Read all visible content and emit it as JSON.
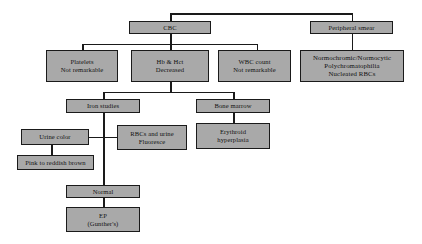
{
  "diagram": {
    "style": {
      "box_fill": "#a9a9a9",
      "box_border": "#1a1a1a",
      "background": "#ffffff",
      "text": "#111111"
    },
    "nodes": {
      "cbc": {
        "lines": [
          "CBC"
        ]
      },
      "peripheral": {
        "lines": [
          "Peripheral smear"
        ]
      },
      "platelets": {
        "lines": [
          "Platelets",
          "Not remarkable"
        ]
      },
      "hb_hct": {
        "lines": [
          "Hb & Hct",
          "Decreased"
        ]
      },
      "wbc": {
        "lines": [
          "WBC count",
          "Not remarkable"
        ]
      },
      "smear_findings": {
        "lines": [
          "Normochromic/Normocytic",
          "Polychromatophilia",
          "Nucleated RBCs"
        ]
      },
      "iron_studies": {
        "lines": [
          "Iron studies"
        ]
      },
      "bone_marrow": {
        "lines": [
          "Bone marrow"
        ]
      },
      "urine_color": {
        "lines": [
          "Urine color"
        ]
      },
      "rbc_fluoresce": {
        "lines": [
          "RBCs and urine",
          "Fluoresce"
        ]
      },
      "erythroid": {
        "lines": [
          "Erythroid",
          "hyperplasia"
        ]
      },
      "pink_brown": {
        "lines": [
          "Pink to reddish brown"
        ]
      },
      "normal": {
        "lines": [
          "Normal"
        ]
      },
      "ep": {
        "lines": [
          "EP",
          "(Gunther's)"
        ]
      }
    }
  }
}
